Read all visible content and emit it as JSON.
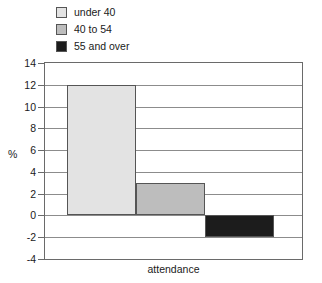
{
  "chart_data": {
    "type": "bar",
    "title": "",
    "xlabel": "attendance",
    "ylabel": "%",
    "categories": [
      "attendance"
    ],
    "ylim": [
      -4,
      14
    ],
    "yticks": [
      -4,
      -2,
      0,
      2,
      4,
      6,
      8,
      10,
      12,
      14
    ],
    "ytick_labels": [
      "-4",
      "-2",
      "0",
      "2",
      "4",
      "6",
      "8",
      "10",
      "12",
      "14"
    ],
    "grid": true,
    "legend_position": "top-left",
    "series": [
      {
        "name": "under 40",
        "values": [
          12
        ],
        "color": "#e3e3e3"
      },
      {
        "name": "40 to 54",
        "values": [
          3
        ],
        "color": "#bdbdbd"
      },
      {
        "name": "55 and over",
        "values": [
          -2
        ],
        "color": "#1c1c1c"
      }
    ]
  },
  "legend": {
    "items": [
      {
        "label": "under 40",
        "swatch": "#e3e3e3"
      },
      {
        "label": "40 to 54",
        "swatch": "#bdbdbd"
      },
      {
        "label": "55 and over",
        "swatch": "#1c1c1c"
      }
    ]
  },
  "axes": {
    "y_title": "%",
    "x_title": "attendance"
  }
}
